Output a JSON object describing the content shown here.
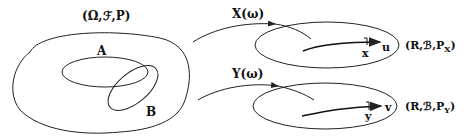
{
  "diagram": {
    "sample_space_label": "(Ω,ℱ,P)",
    "event_a_label": "A",
    "event_b_label": "B",
    "map_x_label": "X(ω)",
    "map_y_label": "Y(ω)",
    "range_x_label": "(R,ℬ,P",
    "range_x_sub": "X",
    "range_y_label": "(R,ℬ,P",
    "range_y_sub": "Y",
    "axis_x_end": "u",
    "axis_x_point": "x",
    "axis_y_end": "v",
    "axis_y_point": "y",
    "stroke_color": "#222222"
  }
}
